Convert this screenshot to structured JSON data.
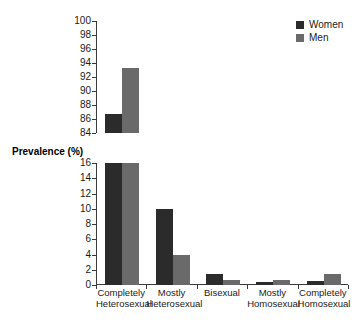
{
  "chart_data": {
    "type": "bar",
    "title": "",
    "xlabel": "",
    "ylabel": "Prevalence (%)",
    "grid": false,
    "legend_position": "top-right",
    "broken_axis": true,
    "categories": [
      "Completely Heterosexual",
      "Mostly Heterosexual",
      "Bisexual",
      "Mostly Homosexual",
      "Completely Homosexual"
    ],
    "category_lines": [
      [
        "Completely",
        "Heterosexual"
      ],
      [
        "Mostly",
        "Heterosexual"
      ],
      [
        "Bisexual",
        ""
      ],
      [
        "Mostly",
        "Homosexual"
      ],
      [
        "Completely",
        "Homosexual"
      ]
    ],
    "series": [
      {
        "name": "Women",
        "color": "#2b2b2b",
        "values": [
          86.7,
          10.0,
          1.4,
          0.4,
          0.5
        ]
      },
      {
        "name": "Men",
        "color": "#6a6a6a",
        "values": [
          93.3,
          3.9,
          0.6,
          0.7,
          1.4
        ]
      }
    ],
    "axes": [
      {
        "id": "upper",
        "ylim": [
          84,
          100
        ],
        "ticks": [
          84,
          86,
          88,
          90,
          92,
          94,
          96,
          98,
          100
        ],
        "tick_labels": [
          "84",
          "86",
          "88",
          "90",
          "92",
          "94",
          "96",
          "98",
          "100"
        ]
      },
      {
        "id": "lower",
        "ylim": [
          0,
          16
        ],
        "ticks": [
          0,
          2,
          4,
          6,
          8,
          10,
          12,
          14,
          16
        ],
        "tick_labels": [
          "0",
          "2",
          "4",
          "6",
          "8",
          "10",
          "12",
          "14",
          "16"
        ]
      }
    ]
  },
  "legend": {
    "items": [
      {
        "label": "Women",
        "swatch": "legend-swatch-women"
      },
      {
        "label": "Men",
        "swatch": "legend-swatch-men"
      }
    ]
  },
  "labels": {
    "y_axis_title": "Prevalence (%)"
  }
}
